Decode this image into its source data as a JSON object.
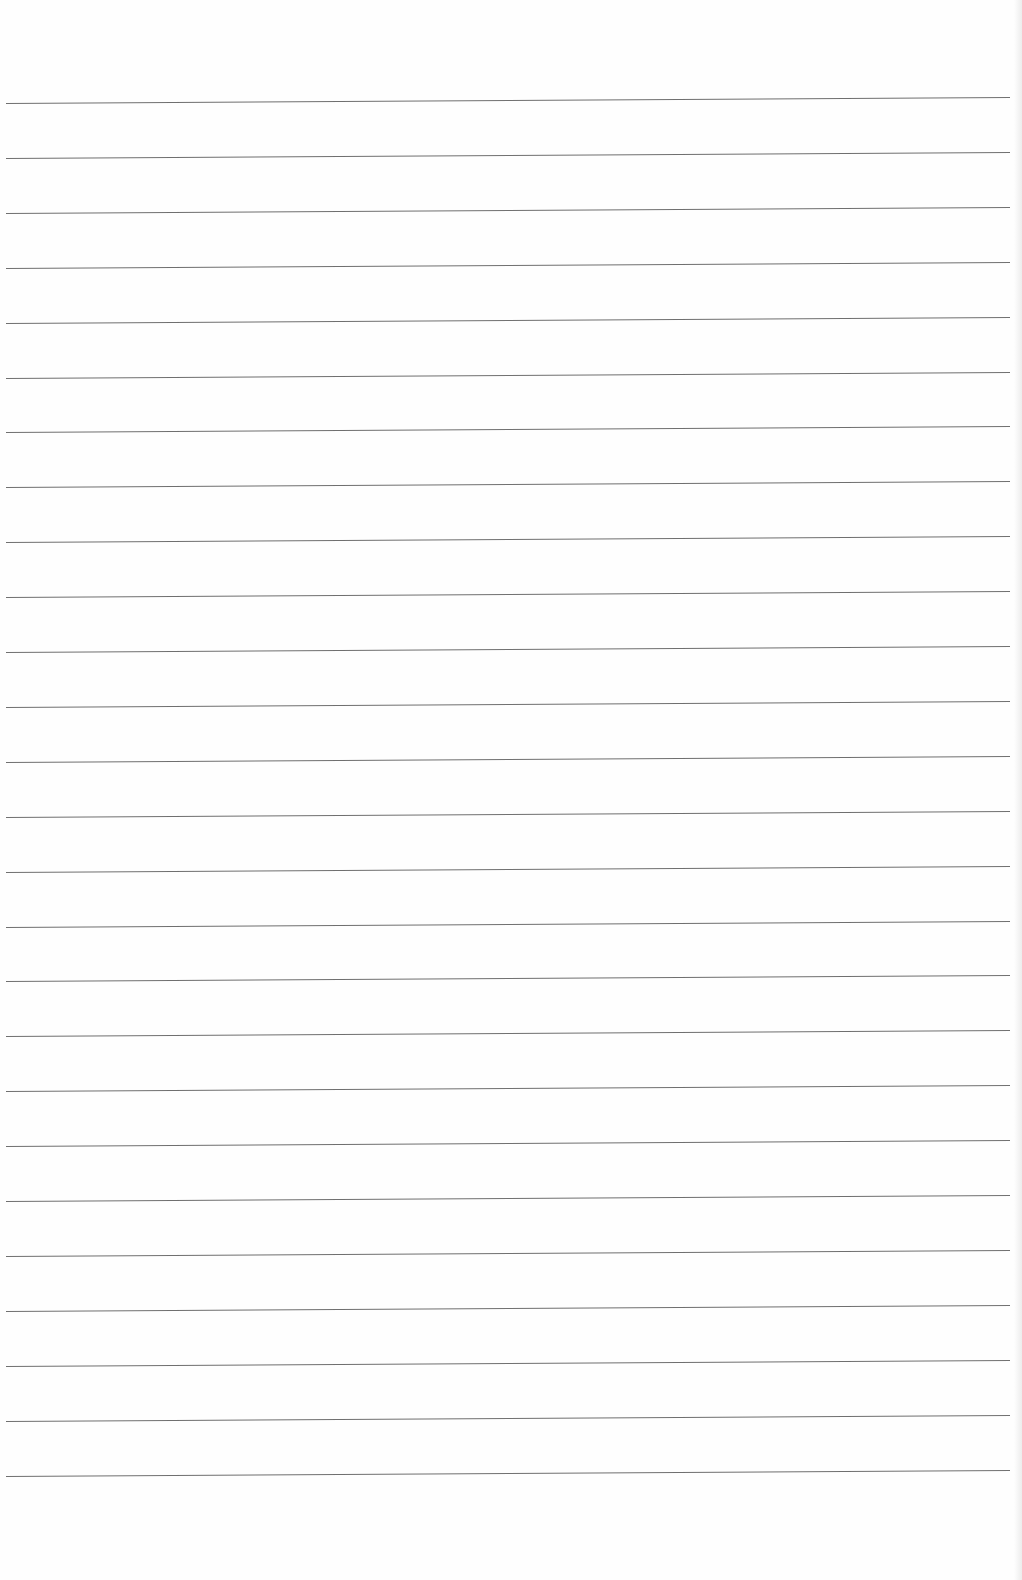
{
  "page": {
    "type": "lined-paper",
    "background_color": "#fefefe",
    "line_color": "#6f6f6f",
    "line_count": 26,
    "first_line_y": 103,
    "line_spacing": 54.9,
    "text_content": ""
  }
}
